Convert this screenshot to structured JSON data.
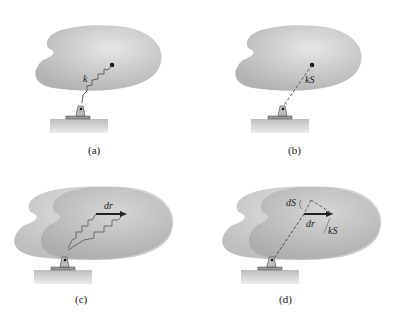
{
  "panels": [
    {
      "id": "a",
      "caption": "(a)",
      "labels": {
        "spring": "k"
      }
    },
    {
      "id": "b",
      "caption": "(b)",
      "labels": {
        "force": "kS"
      }
    },
    {
      "id": "c",
      "caption": "(c)",
      "labels": {
        "displacement": "dr"
      }
    },
    {
      "id": "d",
      "caption": "(d)",
      "labels": {
        "stretch": "dS",
        "displacement": "dr",
        "force": "kS"
      }
    }
  ],
  "colors": {
    "body": "#b9b9b9",
    "body_light": "#d4d4d4",
    "body_dark": "#a6a6a6",
    "ground": "#d8d8d8",
    "ink": "#222222"
  }
}
